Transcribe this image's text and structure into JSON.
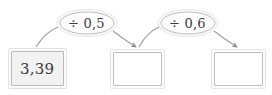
{
  "diagram": {
    "type": "function-machine-flow",
    "background_color": "#ffffff",
    "stroke_color": "#b9b9b9",
    "text_color": "#3a3a3a",
    "boxes": [
      {
        "name": "start-value-box",
        "value": "3,39",
        "filled": true
      },
      {
        "name": "result-box-1",
        "value": "",
        "filled": false
      },
      {
        "name": "result-box-2",
        "value": "",
        "filled": false
      }
    ],
    "operations": [
      {
        "name": "operation-divide-by-zero-point-five",
        "label": "÷ 0,5"
      },
      {
        "name": "operation-divide-by-zero-point-six",
        "label": "÷ 0,6"
      }
    ]
  }
}
